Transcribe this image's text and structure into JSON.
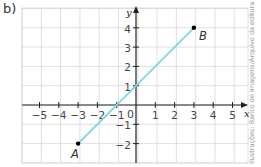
{
  "figure_label": "b)",
  "credit": "Ilustrações: Banco de imagens/Arquivo da editora",
  "colors": {
    "line": "#7fd3e4",
    "grid": "#d8d8d8",
    "axis": "#222222",
    "text": "#444444"
  },
  "chart_data": {
    "type": "line",
    "title": "",
    "xlabel": "x",
    "ylabel": "y",
    "xlim": [
      -5.5,
      5.8
    ],
    "ylim": [
      -3,
      4.6
    ],
    "grid": true,
    "x_ticks": [
      -5,
      -4,
      -3,
      -2,
      -1,
      0,
      1,
      2,
      3,
      4,
      5
    ],
    "y_ticks": [
      -2,
      -1,
      1,
      2,
      3,
      4
    ],
    "series": [
      {
        "name": "segment AB",
        "points": [
          {
            "label": "A",
            "x": -3,
            "y": -2
          },
          {
            "label": "B",
            "x": 3,
            "y": 4
          }
        ]
      }
    ]
  }
}
